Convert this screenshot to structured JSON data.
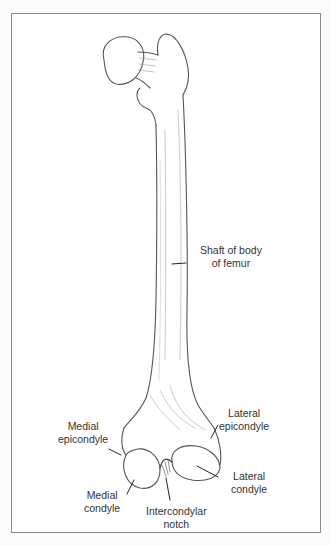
{
  "figure": {
    "labels": {
      "shaft": [
        "Shaft of body",
        "of femur"
      ],
      "medial_epicondyle": [
        "Medial",
        "epicondyle"
      ],
      "lateral_epicondyle": [
        "Lateral",
        "epicondyle"
      ],
      "medial_condyle": [
        "Medial",
        "condyle"
      ],
      "lateral_condyle": [
        "Lateral",
        "condyle"
      ],
      "intercondylar_notch": [
        "Intercondylar",
        "notch"
      ]
    }
  },
  "colors": {
    "border": "#8a8a8a",
    "ink": "#333333",
    "background": "#ffffff"
  }
}
